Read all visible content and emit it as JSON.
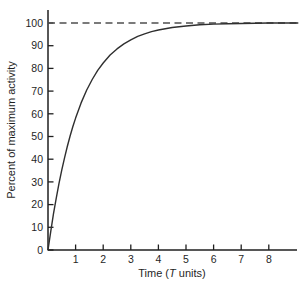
{
  "chart_data": {
    "type": "line",
    "title": "",
    "xlabel_parts": [
      "Time (",
      "T",
      " units)"
    ],
    "ylabel": "Percent of maximum activity",
    "x_ticks": [
      1,
      2,
      3,
      4,
      5,
      6,
      7,
      8
    ],
    "y_ticks": [
      0,
      10,
      20,
      30,
      40,
      50,
      60,
      70,
      80,
      90,
      100
    ],
    "xlim": [
      0,
      9.1
    ],
    "ylim": [
      0,
      105
    ],
    "grid": false,
    "legend": "none",
    "asymptote": {
      "y": 100,
      "style": "dashed"
    },
    "series": [
      {
        "name": "percent-of-maximum-activity",
        "points": [
          [
            0,
            0
          ],
          [
            0.1,
            8.3
          ],
          [
            0.2,
            16.0
          ],
          [
            0.3,
            23.0
          ],
          [
            0.4,
            29.4
          ],
          [
            0.5,
            35.3
          ],
          [
            0.6,
            40.7
          ],
          [
            0.7,
            45.6
          ],
          [
            0.8,
            50.2
          ],
          [
            0.9,
            54.3
          ],
          [
            1.0,
            58.1
          ],
          [
            1.2,
            64.8
          ],
          [
            1.4,
            70.4
          ],
          [
            1.6,
            75.1
          ],
          [
            1.8,
            79.1
          ],
          [
            2.0,
            82.4
          ],
          [
            2.25,
            85.9
          ],
          [
            2.5,
            88.6
          ],
          [
            2.75,
            90.8
          ],
          [
            3.0,
            92.6
          ],
          [
            3.25,
            94.1
          ],
          [
            3.5,
            95.2
          ],
          [
            3.75,
            96.2
          ],
          [
            4.0,
            96.9
          ],
          [
            4.5,
            98.0
          ],
          [
            5.0,
            98.7
          ],
          [
            5.5,
            99.2
          ],
          [
            6.0,
            99.5
          ],
          [
            6.5,
            99.7
          ],
          [
            7.0,
            99.8
          ],
          [
            7.5,
            99.9
          ],
          [
            8.0,
            100
          ],
          [
            9.05,
            100
          ]
        ]
      }
    ],
    "colors": {
      "curve": "#2f2f2f",
      "axis": "#1f1f1f",
      "dash": "#4f4f4f",
      "text": "#1f1f1f",
      "background": "#ffffff"
    }
  }
}
